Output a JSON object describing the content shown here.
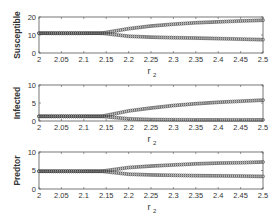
{
  "chart_data": [
    {
      "type": "scatter",
      "title": "",
      "xlabel": "r2",
      "ylabel": "Susceptible",
      "xlim": [
        2,
        2.5
      ],
      "ylim": [
        0,
        20
      ],
      "xticks": [
        2,
        2.05,
        2.1,
        2.15,
        2.2,
        2.25,
        2.3,
        2.35,
        2.4,
        2.45,
        2.5
      ],
      "xtick_labels": [
        "2",
        "2.05",
        "2.1",
        "2.15",
        "2.2",
        "2.25",
        "2.3",
        "2.35",
        "2.4",
        "2.45",
        "2.5"
      ],
      "yticks": [
        0,
        10,
        20
      ],
      "ytick_labels": [
        "0",
        "10",
        "20"
      ],
      "grid": false,
      "bifurcation_point": 2.14,
      "series": [
        {
          "name": "upper branch",
          "x": [
            2.0,
            2.05,
            2.1,
            2.14,
            2.2,
            2.25,
            2.3,
            2.35,
            2.4,
            2.45,
            2.5
          ],
          "values": [
            11,
            11,
            11,
            11,
            13.5,
            15,
            16,
            16.8,
            17.3,
            17.8,
            18.2
          ]
        },
        {
          "name": "lower branch",
          "x": [
            2.0,
            2.05,
            2.1,
            2.14,
            2.2,
            2.25,
            2.3,
            2.35,
            2.4,
            2.45,
            2.5
          ],
          "values": [
            11,
            11,
            11,
            11,
            9.3,
            8.8,
            8.5,
            8.3,
            8.0,
            7.7,
            7.4
          ]
        }
      ]
    },
    {
      "type": "scatter",
      "title": "",
      "xlabel": "r2",
      "ylabel": "Infected",
      "xlim": [
        2,
        2.5
      ],
      "ylim": [
        0,
        10
      ],
      "xticks": [
        2,
        2.05,
        2.1,
        2.15,
        2.2,
        2.25,
        2.3,
        2.35,
        2.4,
        2.45,
        2.5
      ],
      "xtick_labels": [
        "2",
        "2.05",
        "2.1",
        "2.15",
        "2.2",
        "2.25",
        "2.3",
        "2.35",
        "2.4",
        "2.45",
        "2.5"
      ],
      "yticks": [
        0,
        5,
        10
      ],
      "ytick_labels": [
        "0",
        "5",
        "10"
      ],
      "grid": false,
      "bifurcation_point": 2.14,
      "series": [
        {
          "name": "upper branch",
          "x": [
            2.0,
            2.05,
            2.1,
            2.14,
            2.2,
            2.25,
            2.3,
            2.35,
            2.4,
            2.45,
            2.5
          ],
          "values": [
            1.3,
            1.3,
            1.3,
            1.3,
            2.8,
            3.6,
            4.3,
            4.8,
            5.2,
            5.5,
            5.8
          ]
        },
        {
          "name": "lower branch",
          "x": [
            2.0,
            2.05,
            2.1,
            2.14,
            2.2,
            2.25,
            2.3,
            2.35,
            2.4,
            2.45,
            2.5
          ],
          "values": [
            1.3,
            1.3,
            1.3,
            1.3,
            0.6,
            0.4,
            0.35,
            0.3,
            0.3,
            0.3,
            0.3
          ]
        }
      ]
    },
    {
      "type": "scatter",
      "title": "",
      "xlabel": "r2",
      "ylabel": "Predtor",
      "xlim": [
        2,
        2.5
      ],
      "ylim": [
        0,
        10
      ],
      "xticks": [
        2,
        2.05,
        2.1,
        2.15,
        2.2,
        2.25,
        2.3,
        2.35,
        2.4,
        2.45,
        2.5
      ],
      "xtick_labels": [
        "2",
        "2.05",
        "2.1",
        "2.15",
        "2.2",
        "2.25",
        "2.3",
        "2.35",
        "2.4",
        "2.45",
        "2.5"
      ],
      "yticks": [
        0,
        5,
        10
      ],
      "ytick_labels": [
        "0",
        "5",
        "10"
      ],
      "grid": false,
      "bifurcation_point": 2.14,
      "series": [
        {
          "name": "upper branch",
          "x": [
            2.0,
            2.05,
            2.1,
            2.14,
            2.2,
            2.25,
            2.3,
            2.35,
            2.4,
            2.45,
            2.5
          ],
          "values": [
            4.8,
            4.8,
            4.8,
            4.8,
            5.8,
            6.2,
            6.5,
            6.8,
            7.0,
            7.1,
            7.3
          ]
        },
        {
          "name": "lower branch",
          "x": [
            2.0,
            2.05,
            2.1,
            2.14,
            2.2,
            2.25,
            2.3,
            2.35,
            2.4,
            2.45,
            2.5
          ],
          "values": [
            4.8,
            4.8,
            4.8,
            4.8,
            4.0,
            3.8,
            3.7,
            3.6,
            3.55,
            3.5,
            3.4
          ]
        }
      ]
    }
  ],
  "style": {
    "marker_color": "#3a3a3a",
    "axis_color": "#555555",
    "text_color": "#333333",
    "background": "#ffffff"
  },
  "layout": {
    "plot_left": 39,
    "plot_right": 263,
    "panels": [
      {
        "top": 17,
        "bottom": 53
      },
      {
        "top": 85,
        "bottom": 121
      },
      {
        "top": 152,
        "bottom": 189
      }
    ]
  }
}
